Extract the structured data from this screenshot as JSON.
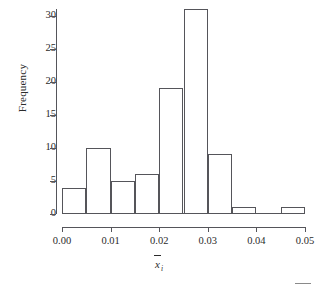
{
  "chart_data": {
    "type": "bar",
    "title": "",
    "subtitle": "",
    "xlabel": "x̄i",
    "xlabel_base": "x",
    "xlabel_subscript": "i",
    "ylabel": "Frequency",
    "xlim": [
      0.0,
      0.05
    ],
    "ylim": [
      0,
      31
    ],
    "grid": false,
    "legend": null,
    "bin_width": 0.005,
    "bin_edges": [
      0.0,
      0.005,
      0.01,
      0.015,
      0.02,
      0.025,
      0.03,
      0.035,
      0.04,
      0.045,
      0.05
    ],
    "categories": [
      "0.000-0.005",
      "0.005-0.010",
      "0.010-0.015",
      "0.015-0.020",
      "0.020-0.025",
      "0.025-0.030",
      "0.030-0.035",
      "0.035-0.040",
      "0.040-0.045",
      "0.045-0.050"
    ],
    "values": [
      4,
      10,
      5,
      6,
      19,
      31,
      9,
      1,
      0,
      1
    ],
    "total_count": 86,
    "x_ticks": [
      {
        "value": 0.0,
        "label": "0.00"
      },
      {
        "value": 0.01,
        "label": "0.01"
      },
      {
        "value": 0.02,
        "label": "0.02"
      },
      {
        "value": 0.03,
        "label": "0.03"
      },
      {
        "value": 0.04,
        "label": "0.04"
      },
      {
        "value": 0.05,
        "label": "0.05"
      }
    ],
    "y_ticks": [
      {
        "value": 0,
        "label": "0"
      },
      {
        "value": 5,
        "label": "5"
      },
      {
        "value": 10,
        "label": "10"
      },
      {
        "value": 15,
        "label": "15"
      },
      {
        "value": 20,
        "label": "20"
      },
      {
        "value": 25,
        "label": "25"
      },
      {
        "value": 30,
        "label": "30"
      }
    ],
    "colors": {
      "axis": "#55555a",
      "bar_stroke": "#55555a",
      "bar_fill": "transparent",
      "text": "#2b2b2b",
      "background": "#ffffff"
    }
  }
}
